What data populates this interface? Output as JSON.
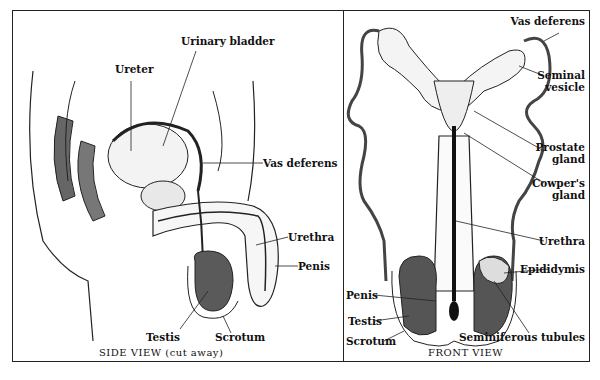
{
  "side_view": {
    "caption": "SIDE VIEW (cut away)",
    "labels": {
      "ureter": "Ureter",
      "urinary_bladder": "Urinary bladder",
      "vas_deferens": "Vas deferens",
      "urethra": "Urethra",
      "penis": "Penis",
      "testis": "Testis",
      "scrotum": "Scrotum"
    }
  },
  "front_view": {
    "caption": "FRONT VIEW",
    "labels": {
      "vas_deferens": "Vas deferens",
      "seminal_vesicle_1": "Seminal",
      "seminal_vesicle_2": "vesicle",
      "prostate_1": "Prostate",
      "prostate_2": "gland",
      "cowpers_1": "Cowper's",
      "cowpers_2": "gland",
      "urethra": "Urethra",
      "epididymis": "Epididymis",
      "penis": "Penis",
      "testis": "Testis",
      "scrotum": "Scrotum",
      "seminiferous_tubules": "Seminiferous tubules"
    }
  },
  "colors": {
    "ink": "#222222",
    "tissue_dark": "#555555",
    "background": "#ffffff"
  }
}
